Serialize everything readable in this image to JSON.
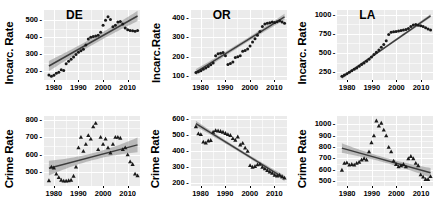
{
  "figure": {
    "type": "scatter-grid",
    "rows": 2,
    "cols": 3,
    "background": "#ebebeb",
    "gridline_color": "#ffffff",
    "point_color": "#1a1a1a",
    "fit_line_color": "#3d3d3d",
    "confidence_band_color": "#9a9a9a"
  },
  "chart_data": [
    {
      "type": "scatter",
      "title": "DE",
      "xlabel": "",
      "ylabel": "Incarc. Rate",
      "xlim": [
        1976,
        2015
      ],
      "ylim": [
        150,
        560
      ],
      "xticks": [
        1980,
        1990,
        2000,
        2010
      ],
      "yticks": [
        200,
        300,
        400,
        500
      ],
      "grid": true,
      "point_shape": "circle",
      "x": [
        1978,
        1979,
        1980,
        1981,
        1982,
        1983,
        1984,
        1985,
        1986,
        1987,
        1988,
        1989,
        1990,
        1991,
        1992,
        1993,
        1994,
        1995,
        1996,
        1997,
        1998,
        1999,
        2000,
        2001,
        2002,
        2003,
        2004,
        2005,
        2006,
        2007,
        2008,
        2009,
        2010,
        2011,
        2012,
        2013,
        2014
      ],
      "y": [
        180,
        172,
        178,
        190,
        196,
        210,
        205,
        245,
        260,
        272,
        285,
        300,
        312,
        322,
        330,
        355,
        390,
        400,
        405,
        408,
        412,
        430,
        470,
        500,
        520,
        505,
        462,
        470,
        490,
        492,
        478,
        455,
        445,
        440,
        438,
        435,
        440
      ],
      "fit": {
        "x": [
          1978,
          2014
        ],
        "y_start": 232,
        "y_end": 525
      },
      "band_halfwidth": {
        "center": 20,
        "ends": 30
      }
    },
    {
      "type": "scatter",
      "title": "OR",
      "xlabel": "",
      "ylabel": "Incarc.Rate",
      "xlim": [
        1976,
        2015
      ],
      "ylim": [
        80,
        440
      ],
      "xticks": [
        1980,
        1990,
        2000,
        2010
      ],
      "yticks": [
        100,
        200,
        300,
        400
      ],
      "grid": true,
      "point_shape": "circle",
      "x": [
        1978,
        1979,
        1980,
        1981,
        1982,
        1983,
        1984,
        1985,
        1986,
        1987,
        1988,
        1989,
        1990,
        1991,
        1992,
        1993,
        1994,
        1995,
        1996,
        1997,
        1998,
        1999,
        2000,
        2001,
        2002,
        2003,
        2004,
        2005,
        2006,
        2007,
        2008,
        2009,
        2010,
        2011,
        2012,
        2013,
        2014
      ],
      "y": [
        118,
        122,
        128,
        135,
        142,
        150,
        158,
        168,
        205,
        215,
        218,
        222,
        205,
        160,
        165,
        172,
        196,
        200,
        205,
        228,
        232,
        240,
        255,
        275,
        292,
        310,
        330,
        355,
        368,
        372,
        375,
        378,
        376,
        380,
        385,
        378,
        372
      ],
      "fit": {
        "x": [
          1978,
          2014
        ],
        "y_start": 120,
        "y_end": 405
      },
      "band_halfwidth": {
        "center": 10,
        "ends": 16
      }
    },
    {
      "type": "scatter",
      "title": "LA",
      "xlabel": "",
      "ylabel": "Incarc. Rate",
      "xlim": [
        1976,
        2015
      ],
      "ylim": [
        150,
        1060
      ],
      "xticks": [
        1980,
        1990,
        2000,
        2010
      ],
      "yticks": [
        250,
        500,
        750,
        1000
      ],
      "grid": true,
      "point_shape": "circle",
      "x": [
        1978,
        1979,
        1980,
        1981,
        1982,
        1983,
        1984,
        1985,
        1986,
        1987,
        1988,
        1989,
        1990,
        1991,
        1992,
        1993,
        1994,
        1995,
        1996,
        1997,
        1998,
        1999,
        2000,
        2001,
        2002,
        2003,
        2004,
        2005,
        2006,
        2007,
        2008,
        2009,
        2010,
        2011,
        2012,
        2013,
        2014
      ],
      "y": [
        200,
        215,
        230,
        250,
        270,
        290,
        305,
        330,
        350,
        370,
        395,
        420,
        450,
        480,
        510,
        540,
        575,
        610,
        660,
        740,
        770,
        778,
        782,
        788,
        795,
        800,
        808,
        820,
        845,
        865,
        870,
        862,
        855,
        845,
        830,
        812,
        800
      ],
      "fit": {
        "x": [
          1978,
          2014
        ],
        "y_start": 185,
        "y_end": 985
      },
      "band_halfwidth": {
        "center": 14,
        "ends": 22
      }
    },
    {
      "type": "scatter",
      "title": "",
      "xlabel": "",
      "ylabel": "Crime Rate",
      "xlim": [
        1976,
        2015
      ],
      "ylim": [
        420,
        820
      ],
      "xticks": [
        1980,
        1990,
        2000,
        2010
      ],
      "yticks": [
        500,
        600,
        700,
        800
      ],
      "grid": true,
      "point_shape": "triangle",
      "x": [
        1978,
        1979,
        1980,
        1981,
        1982,
        1983,
        1984,
        1985,
        1986,
        1987,
        1988,
        1989,
        1990,
        1991,
        1992,
        1993,
        1994,
        1995,
        1996,
        1997,
        1998,
        1999,
        2000,
        2001,
        2002,
        2003,
        2004,
        2005,
        2006,
        2007,
        2008,
        2009,
        2010,
        2011,
        2012,
        2013,
        2014
      ],
      "y": [
        452,
        530,
        525,
        490,
        470,
        455,
        450,
        450,
        452,
        455,
        478,
        530,
        640,
        700,
        620,
        660,
        710,
        690,
        760,
        780,
        630,
        700,
        660,
        690,
        640,
        610,
        660,
        700,
        700,
        695,
        630,
        640,
        600,
        560,
        545,
        490,
        480
      ],
      "fit": {
        "x": [
          1978,
          2014
        ],
        "y_start": 522,
        "y_end": 655
      },
      "band_halfwidth": {
        "center": 20,
        "ends": 42
      }
    },
    {
      "type": "scatter",
      "title": "",
      "xlabel": "",
      "ylabel": "Crime Rate",
      "xlim": [
        1976,
        2015
      ],
      "ylim": [
        180,
        620
      ],
      "xticks": [
        1980,
        1990,
        2000,
        2010
      ],
      "yticks": [
        200,
        300,
        400,
        500,
        600
      ],
      "grid": true,
      "point_shape": "triangle",
      "x": [
        1978,
        1979,
        1980,
        1981,
        1982,
        1983,
        1984,
        1985,
        1986,
        1987,
        1988,
        1989,
        1990,
        1991,
        1992,
        1993,
        1994,
        1995,
        1996,
        1997,
        1998,
        1999,
        2000,
        2001,
        2002,
        2003,
        2004,
        2005,
        2006,
        2007,
        2008,
        2009,
        2010,
        2011,
        2012,
        2013,
        2014
      ],
      "y": [
        555,
        510,
        505,
        458,
        452,
        465,
        468,
        520,
        530,
        528,
        525,
        520,
        512,
        505,
        500,
        480,
        470,
        490,
        440,
        450,
        420,
        400,
        310,
        300,
        305,
        315,
        318,
        300,
        290,
        280,
        270,
        262,
        250,
        245,
        250,
        240,
        232
      ],
      "fit": {
        "x": [
          1978,
          2014
        ],
        "y_start": 572,
        "y_end": 228
      },
      "band_halfwidth": {
        "center": 10,
        "ends": 18
      }
    },
    {
      "type": "scatter",
      "title": "",
      "xlabel": "",
      "ylabel": "Crime Rate",
      "xlim": [
        1976,
        2015
      ],
      "ylim": [
        460,
        1070
      ],
      "xticks": [
        1980,
        1990,
        2000,
        2010
      ],
      "yticks": [
        500,
        600,
        700,
        800,
        900,
        1000
      ],
      "grid": true,
      "point_shape": "triangle",
      "x": [
        1978,
        1979,
        1980,
        1981,
        1982,
        1983,
        1984,
        1985,
        1986,
        1987,
        1988,
        1989,
        1990,
        1991,
        1992,
        1993,
        1994,
        1995,
        1996,
        1997,
        1998,
        1999,
        2000,
        2001,
        2002,
        2003,
        2004,
        2005,
        2006,
        2007,
        2008,
        2009,
        2010,
        2011,
        2012,
        2013,
        2014
      ],
      "y": [
        600,
        660,
        665,
        645,
        650,
        645,
        660,
        670,
        690,
        700,
        690,
        760,
        840,
        900,
        1030,
        985,
        1010,
        950,
        900,
        800,
        760,
        680,
        650,
        630,
        640,
        650,
        630,
        700,
        720,
        700,
        660,
        640,
        560,
        540,
        520,
        520,
        545
      ],
      "fit": {
        "x": [
          1978,
          2014
        ],
        "y_start": 790,
        "y_end": 575
      },
      "band_halfwidth": {
        "center": 22,
        "ends": 42
      }
    }
  ]
}
